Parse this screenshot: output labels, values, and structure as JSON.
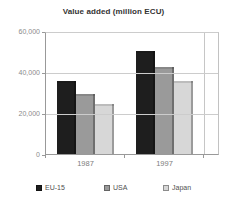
{
  "title": "Value added (million ECU)",
  "chart_data": {
    "type": "bar",
    "title": "Value added (million ECU)",
    "categories": [
      "1987",
      "1997"
    ],
    "series": [
      {
        "name": "EU-15",
        "color": "#1e1e1e",
        "values": [
          36000,
          51000
        ]
      },
      {
        "name": "USA",
        "color": "#9a9a9a",
        "values": [
          30000,
          43000
        ]
      },
      {
        "name": "Japan",
        "color": "#d7d7d7",
        "values": [
          25000,
          36000
        ]
      }
    ],
    "xlabel": "",
    "ylabel": "",
    "ylim": [
      0,
      60000
    ],
    "yticks": [
      {
        "label": "60,000",
        "value": 60000
      },
      {
        "label": "40,000",
        "value": 40000
      },
      {
        "label": "20,000",
        "value": 20000
      },
      {
        "label": "0",
        "value": 0
      }
    ],
    "grid": true,
    "legend_position": "bottom"
  }
}
